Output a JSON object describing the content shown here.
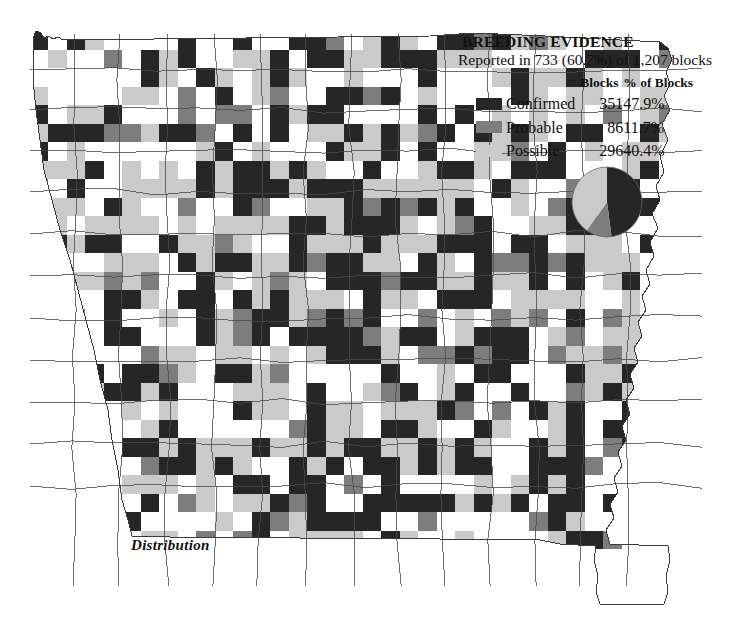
{
  "figure": {
    "caption": "Distribution"
  },
  "legend": {
    "title": "BREEDING EVIDENCE",
    "subtitle": "Reported in 733 (60.7%) of 1,207 blocks",
    "columns": {
      "swatch": "",
      "category": "",
      "blocks": "Blocks",
      "percent": "% of Blocks"
    },
    "rows": [
      {
        "label": "Confirmed",
        "blocks": "351",
        "percent": "47.9%",
        "color": "#262626",
        "value": 47.9
      },
      {
        "label": "Probable",
        "blocks": "86",
        "percent": "11.7%",
        "color": "#7d7d7d",
        "value": 11.7
      },
      {
        "label": "Possible",
        "blocks": "296",
        "percent": "40.4%",
        "color": "#cacaca",
        "value": 40.4
      }
    ]
  },
  "chart_data": {
    "type": "pie",
    "title": "BREEDING EVIDENCE",
    "subtitle": "Reported in 733 (60.7%) of 1,207 blocks",
    "labels": [
      "Confirmed",
      "Probable",
      "Possible"
    ],
    "values": [
      47.9,
      11.7,
      40.4
    ],
    "counts": [
      351,
      86,
      296
    ],
    "colors": [
      "#262626",
      "#7d7d7d",
      "#cacaca"
    ],
    "total_blocks": 1207,
    "reported_blocks": 733,
    "reported_percent": 60.7,
    "legend_position": "above",
    "grid": false,
    "start_angle_deg": 0,
    "direction": "clockwise"
  },
  "map": {
    "name": "missouri-block-grid",
    "outline_color": "#3a3a3a",
    "background": "#ffffff",
    "cell_size": 18.5,
    "categories": [
      "none",
      "possible",
      "probable",
      "confirmed"
    ],
    "category_colors": {
      "none": "#ffffff",
      "possible": "#cacaca",
      "probable": "#7d7d7d",
      "confirmed": "#262626"
    }
  }
}
